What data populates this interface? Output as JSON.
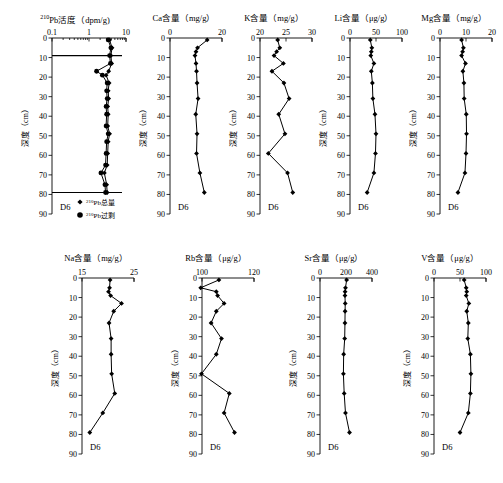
{
  "figure": {
    "core_label": "D6",
    "depth_axis": {
      "name": "深度（cm）",
      "unit": "cm",
      "ticks": [
        0,
        10,
        20,
        30,
        40,
        50,
        60,
        70,
        80,
        90
      ],
      "min": 0,
      "max": 90
    },
    "legend": [
      {
        "marker": "diamond",
        "label_sup": "210",
        "label": "Pb总量"
      },
      {
        "marker": "circle",
        "label_sup": "210",
        "label": "Pb过剩"
      }
    ]
  },
  "chart_data": [
    {
      "type": "scatter",
      "panel": "pb210",
      "title_sup": "210",
      "title": "Pb活度（dpm/g)",
      "xlabel": "210Pb活度 (dpm/g)",
      "ylabel": "深度（cm）",
      "xscale": "log",
      "xlim": [
        0.1,
        10
      ],
      "xticks": [
        0.1,
        1,
        10
      ],
      "xticklabels": [
        "0.1",
        "1",
        "10"
      ],
      "ylim": [
        0,
        90
      ],
      "yticks": [
        0,
        10,
        20,
        30,
        40,
        50,
        60,
        70,
        80,
        90
      ],
      "series": [
        {
          "name": "210Pb总量",
          "marker": "diamond",
          "depth": [
            1,
            5,
            9,
            13,
            17,
            19,
            23,
            27,
            31,
            35,
            39,
            45,
            49,
            53,
            59,
            65,
            69,
            75,
            79
          ],
          "values": [
            3.6,
            4.2,
            3.9,
            4.1,
            3.4,
            2.9,
            3.5,
            3.3,
            3.4,
            3.2,
            3.3,
            3.2,
            3.6,
            3.3,
            3.2,
            3.1,
            2.6,
            3.0,
            3.1
          ]
        },
        {
          "name": "210Pb过剩",
          "marker": "circle",
          "depth": [
            1,
            5,
            9,
            13,
            17,
            19,
            23,
            27,
            31,
            35,
            39,
            45,
            49,
            53,
            59,
            65,
            69,
            75,
            79
          ],
          "values": [
            3.3,
            3.9,
            3.6,
            3.8,
            1.6,
            2.3,
            3.1,
            3.0,
            3.1,
            2.9,
            3.0,
            2.9,
            3.3,
            3.0,
            2.9,
            2.8,
            2.1,
            2.7,
            2.8
          ]
        }
      ],
      "markers_hbar": [
        9,
        79
      ]
    },
    {
      "type": "line",
      "panel": "ca",
      "title": "Ca含量（mg/g）",
      "xlabel": "Ca含量 (mg/g)",
      "ylabel": "深度（cm）",
      "xlim": [
        0,
        20
      ],
      "xticks": [
        0,
        20
      ],
      "xticklabels": [
        "0",
        "20"
      ],
      "ylim": [
        0,
        90
      ],
      "depth": [
        1,
        5,
        7,
        9,
        13,
        17,
        23,
        31,
        39,
        49,
        59,
        69,
        79
      ],
      "values": [
        14.3,
        10.6,
        10.0,
        9.6,
        10.0,
        10.2,
        10.4,
        10.8,
        9.9,
        10.4,
        10.2,
        11.5,
        13.2
      ]
    },
    {
      "type": "line",
      "panel": "k",
      "title": "K含量（mg/g）",
      "xlabel": "K含量 (mg/g)",
      "ylabel": "深度（cm）",
      "xlim": [
        20,
        30
      ],
      "xticks": [
        20,
        25,
        30
      ],
      "xticklabels": [
        "20",
        "25",
        "30"
      ],
      "ylim": [
        0,
        90
      ],
      "depth": [
        1,
        5,
        7,
        9,
        13,
        17,
        23,
        31,
        39,
        49,
        59,
        69,
        79
      ],
      "values": [
        23.4,
        23.8,
        23.2,
        22.7,
        24.5,
        22.3,
        24.6,
        25.6,
        23.6,
        24.8,
        21.6,
        25.3,
        26.3
      ]
    },
    {
      "type": "line",
      "panel": "li",
      "title": "Li含量（μg/g）",
      "xlabel": "Li含量 (μg/g)",
      "ylabel": "深度（cm）",
      "xlim": [
        0,
        100
      ],
      "xticks": [
        0,
        50,
        100
      ],
      "xticklabels": [
        "0",
        "50",
        "100"
      ],
      "ylim": [
        0,
        90
      ],
      "depth": [
        1,
        5,
        7,
        9,
        13,
        17,
        23,
        31,
        39,
        49,
        59,
        69,
        79
      ],
      "values": [
        39,
        42,
        41,
        40,
        46,
        41,
        43,
        44,
        48,
        50,
        49,
        46,
        33
      ]
    },
    {
      "type": "line",
      "panel": "mg",
      "title": "Mg含量（mg/g）",
      "xlabel": "Mg含量 (mg/g)",
      "ylabel": "深度（cm）",
      "xlim": [
        0,
        20
      ],
      "xticks": [
        0,
        10,
        20
      ],
      "xticklabels": [
        "0",
        "10",
        "20"
      ],
      "ylim": [
        0,
        90
      ],
      "depth": [
        1,
        5,
        7,
        9,
        13,
        17,
        23,
        31,
        39,
        49,
        59,
        69,
        79
      ],
      "values": [
        8.3,
        9.0,
        8.7,
        8.3,
        9.8,
        8.8,
        9.2,
        9.3,
        10.1,
        10.2,
        10.0,
        9.6,
        6.9
      ]
    },
    {
      "type": "line",
      "panel": "na",
      "title": "Na含量（mg/g）",
      "xlabel": "Na含量 (mg/g)",
      "ylabel": "深度（cm）",
      "xlim": [
        15,
        25
      ],
      "xticks": [
        15,
        25
      ],
      "xticklabels": [
        "15",
        "25"
      ],
      "ylim": [
        0,
        90
      ],
      "depth": [
        1,
        5,
        7,
        9,
        13,
        17,
        23,
        31,
        39,
        49,
        59,
        69,
        79
      ],
      "values": [
        20.4,
        20.3,
        20.1,
        20.5,
        22.6,
        21.1,
        20.2,
        20.6,
        20.6,
        20.7,
        21.3,
        19.0,
        16.5
      ]
    },
    {
      "type": "line",
      "panel": "rb",
      "title": "Rb含量（μg/g）",
      "xlabel": "Rb含量 (μg/g)",
      "ylabel": "深度（cm）",
      "xlim": [
        100,
        120
      ],
      "xticks": [
        100,
        120
      ],
      "xticklabels": [
        "100",
        "120"
      ],
      "ylim": [
        0,
        90
      ],
      "depth": [
        1,
        5,
        7,
        9,
        13,
        17,
        23,
        31,
        39,
        49,
        59,
        69,
        79
      ],
      "values": [
        106.5,
        99.5,
        105.5,
        106.0,
        108.5,
        105.5,
        103.5,
        107.5,
        105.5,
        99.8,
        110.5,
        108.5,
        112.5
      ]
    },
    {
      "type": "line",
      "panel": "sr",
      "title": "Sr含量（μg/g）",
      "xlabel": "Sr含量 (μg/g)",
      "ylabel": "深度（cm）",
      "xlim": [
        0,
        400
      ],
      "xticks": [
        0,
        200,
        400
      ],
      "xticklabels": [
        "0",
        "200",
        "400"
      ],
      "ylim": [
        0,
        90
      ],
      "depth": [
        1,
        5,
        7,
        9,
        13,
        17,
        23,
        31,
        39,
        49,
        59,
        69,
        79
      ],
      "values": [
        205,
        196,
        193,
        192,
        194,
        193,
        192,
        190,
        182,
        180,
        186,
        196,
        227
      ]
    },
    {
      "type": "line",
      "panel": "v",
      "title": "V含量（μg/g）",
      "xlabel": "V含量 (μg/g)",
      "ylabel": "深度（cm）",
      "xlim": [
        0,
        100
      ],
      "xticks": [
        0,
        50,
        100
      ],
      "xticklabels": [
        "0",
        "50",
        "100"
      ],
      "ylim": [
        0,
        90
      ],
      "depth": [
        1,
        5,
        7,
        9,
        13,
        17,
        23,
        31,
        39,
        49,
        59,
        69,
        79
      ],
      "values": [
        58,
        62,
        63,
        62,
        67,
        63,
        66,
        65,
        70,
        71,
        70,
        66,
        50
      ]
    }
  ]
}
